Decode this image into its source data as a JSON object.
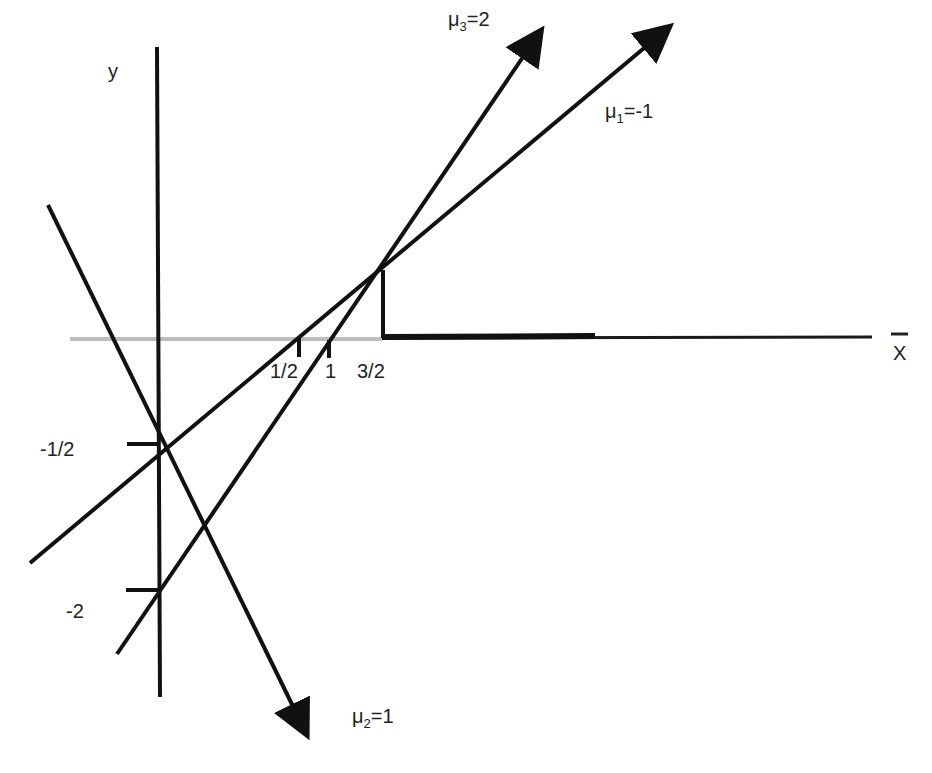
{
  "axes": {
    "y_label": "y",
    "x_label": "X",
    "x_label_has_bar": true
  },
  "x_ticks": [
    {
      "label": "1/2",
      "value": 0.5
    },
    {
      "label": "1",
      "value": 1
    },
    {
      "label": "3/2",
      "value": 1.5
    }
  ],
  "y_ticks": [
    {
      "label": "-1/2",
      "value": -0.5
    },
    {
      "label": "-2",
      "value": -2
    }
  ],
  "lines": [
    {
      "name": "mu1",
      "label_symbol": "μ",
      "label_sub": "1",
      "label_value": "=-1",
      "equation": "y = x - 1/2 (passes through (1/2,0) and (0,-1/2))"
    },
    {
      "name": "mu2",
      "label_symbol": "μ",
      "label_sub": "2",
      "label_value": "=1",
      "equation": "decreasing line through (0,-1/2)"
    },
    {
      "name": "mu3",
      "label_symbol": "μ",
      "label_sub": "3",
      "label_value": "=2",
      "equation": "y = 2x - 2 (passes through (1,0) and (0,-2))"
    }
  ],
  "highlight": {
    "description": "bold segment on x-axis from x=3/2 rightward, with vertical segment at x=3/2 up to intersection of mu1 and mu3"
  },
  "colors": {
    "line": "#111111",
    "axis_light": "#bbbbbb"
  }
}
